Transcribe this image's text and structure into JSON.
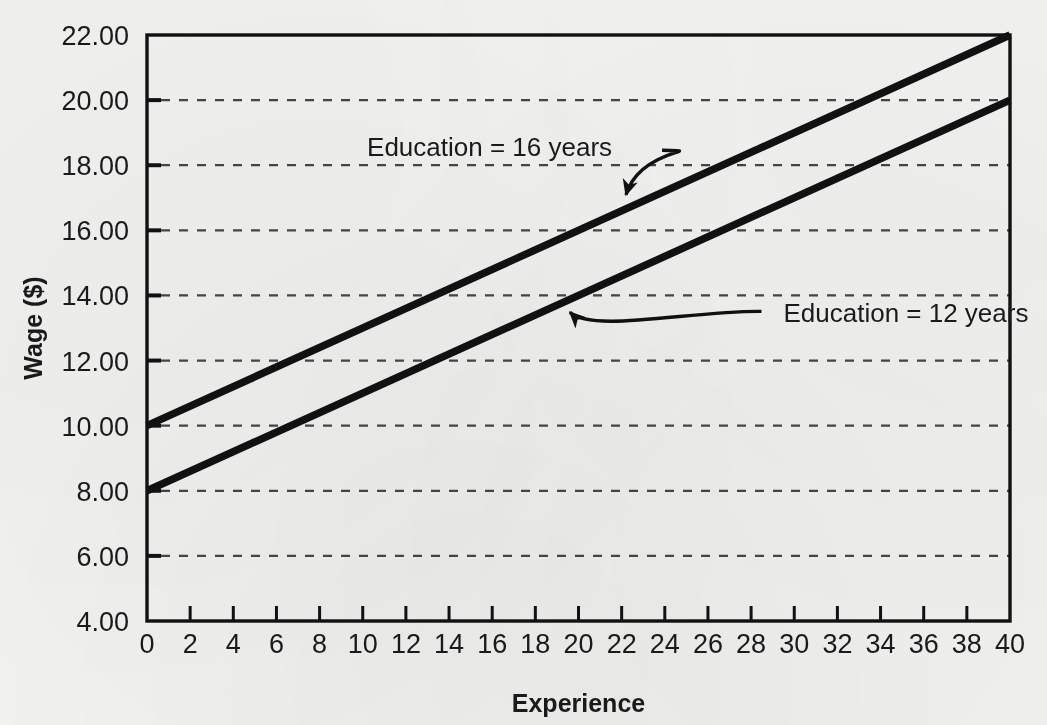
{
  "chart_data": {
    "type": "line",
    "title": "",
    "xlabel": "Experience",
    "ylabel": "Wage ($)",
    "xlim": [
      0,
      40
    ],
    "ylim": [
      4.0,
      22.0
    ],
    "x_ticks": [
      0,
      2,
      4,
      6,
      8,
      10,
      12,
      14,
      16,
      18,
      20,
      22,
      24,
      26,
      28,
      30,
      32,
      34,
      36,
      38,
      40
    ],
    "x_tick_labels": [
      "0",
      "2",
      "4",
      "6",
      "8",
      "10",
      "12",
      "14",
      "16",
      "18",
      "20",
      "22",
      "24",
      "26",
      "28",
      "30",
      "32",
      "34",
      "36",
      "38",
      "40"
    ],
    "y_ticks": [
      4.0,
      6.0,
      8.0,
      10.0,
      12.0,
      14.0,
      16.0,
      18.0,
      20.0,
      22.0
    ],
    "y_tick_labels": [
      "4.00",
      "6.00",
      "8.00",
      "10.00",
      "12.00",
      "14.00",
      "16.00",
      "18.00",
      "20.00",
      "22.00"
    ],
    "grid": "horizontal-dashed",
    "legend_position": "inline-annotations",
    "x": [
      0,
      40
    ],
    "series": [
      {
        "name": "Education = 16 years",
        "values": [
          10.0,
          22.0
        ],
        "intercept": 10.0,
        "slope": 0.3,
        "color": "#111111"
      },
      {
        "name": "Education = 12 years",
        "values": [
          8.0,
          20.0
        ],
        "intercept": 8.0,
        "slope": 0.3,
        "color": "#111111"
      }
    ],
    "annotations": [
      {
        "text": "Education = 16 years",
        "text_x": 10.2,
        "text_y": 18.55,
        "target_x": 22.2,
        "target_y": 16.66
      },
      {
        "text": "Education = 12 years",
        "text_x": 29.5,
        "text_y": 13.45,
        "target_x": 19.6,
        "target_y": 13.88
      }
    ]
  },
  "colors": {
    "background": "#f3f3f2",
    "axis": "#111111",
    "gridline": "#444444",
    "line": "#111111",
    "text": "#1a1a1a"
  }
}
